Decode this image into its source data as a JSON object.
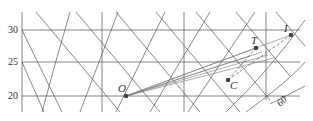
{
  "diagram": {
    "y_ticks": [
      {
        "label": "30",
        "y": 30
      },
      {
        "label": "25",
        "y": 62
      },
      {
        "label": "20",
        "y": 96
      }
    ],
    "points": [
      {
        "id": "O",
        "label": "O",
        "x": 126,
        "y": 96
      },
      {
        "id": "C",
        "label": "C",
        "x": 228,
        "y": 80
      },
      {
        "id": "T",
        "label": "T",
        "x": 256,
        "y": 48
      },
      {
        "id": "I",
        "label": "I",
        "x": 291,
        "y": 35
      }
    ],
    "annotation": {
      "label": "60"
    },
    "colors": {
      "grid": "#555555",
      "lines": "#666666",
      "point": "#444444"
    }
  }
}
